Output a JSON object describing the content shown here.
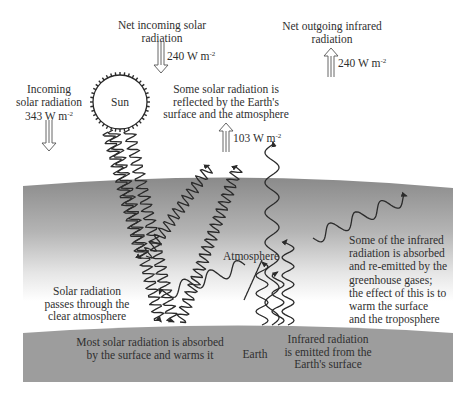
{
  "colors": {
    "atmosphere_top": "#8e8e8e",
    "atmosphere_fade": "#ffffff",
    "earth": "#9c9c9c",
    "wave": "#2b2b2b",
    "text": "#2f2f2f"
  },
  "sun": {
    "label": "Sun"
  },
  "incoming": {
    "lines": [
      "Incoming",
      "solar radiation"
    ],
    "value": "343 W m",
    "exp": "-2"
  },
  "net_incoming": {
    "lines": [
      "Net incoming solar",
      "radiation"
    ],
    "value": "240 W m",
    "exp": "-2"
  },
  "reflected": {
    "lines": [
      "Some solar radiation is",
      "reflected by the Earth's",
      "surface and the atmosphere"
    ],
    "value": "103 W m",
    "exp": "-2"
  },
  "net_outgoing": {
    "lines": [
      "Net outgoing infrared",
      "radiation"
    ],
    "value": "240 W m",
    "exp": "-2"
  },
  "atmosphere_label": "Atmosphere",
  "earth_label": "Earth",
  "passes_through": {
    "lines": [
      "Solar radiation",
      "passes through the",
      "clear atmosphere"
    ]
  },
  "absorbed": {
    "lines": [
      "Most solar radiation is absorbed",
      "by the surface and warms it"
    ]
  },
  "infrared_emitted": {
    "lines": [
      "Infrared radiation",
      "is emitted from the",
      "Earth's surface"
    ]
  },
  "greenhouse": {
    "lines": [
      "Some of the infrared",
      "radiation is absorbed",
      "and re-emitted by the",
      "greenhouse gases;",
      "the effect of this is to",
      "warm the surface",
      "and the troposphere"
    ]
  }
}
